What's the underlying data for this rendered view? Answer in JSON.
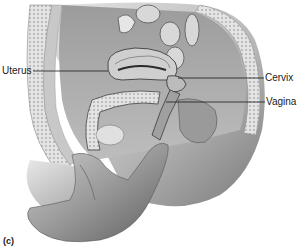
{
  "figure": {
    "panel_tag": "(c)",
    "labels": {
      "uterus": "Uterus",
      "cervix": "Cervix",
      "vagina": "Vagina"
    },
    "colors": {
      "background": "#ffffff",
      "ink": "#1a1a1a",
      "tissue_light": "#d9d9d9",
      "tissue_mid": "#a8a8a8",
      "tissue_dark": "#5a5a5a"
    }
  }
}
